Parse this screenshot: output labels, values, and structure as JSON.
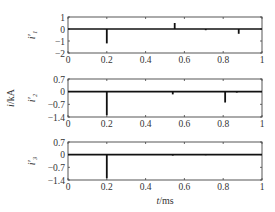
{
  "chart_data": [
    {
      "type": "line",
      "ylabel": "i'1",
      "xlabel": "",
      "xlim": [
        0,
        1
      ],
      "ylim": [
        -2,
        1
      ],
      "xticks": [
        "0",
        "0.2",
        "0.4",
        "0.6",
        "0.8",
        "1"
      ],
      "yticks": [
        "1",
        "0",
        "-1",
        "-2"
      ],
      "baseline": 0,
      "spikes": [
        {
          "x": 0.2,
          "y": -1.2
        },
        {
          "x": 0.55,
          "y": 0.5
        },
        {
          "x": 0.71,
          "y": -0.1
        },
        {
          "x": 0.88,
          "y": -0.4
        }
      ]
    },
    {
      "type": "line",
      "ylabel": "i'2",
      "xlabel": "",
      "xlim": [
        0,
        1
      ],
      "ylim": [
        -1.4,
        0.7
      ],
      "xticks": [
        "0",
        "0.2",
        "0.4",
        "0.6",
        "0.8",
        "1"
      ],
      "yticks": [
        "0.7",
        "0",
        "-0.7",
        "-1.4"
      ],
      "baseline": 0,
      "spikes": [
        {
          "x": 0.2,
          "y": -1.3
        },
        {
          "x": 0.54,
          "y": -0.15
        },
        {
          "x": 0.81,
          "y": -0.6
        },
        {
          "x": 0.87,
          "y": -0.05
        }
      ]
    },
    {
      "type": "line",
      "ylabel": "i'3",
      "xlabel": "t/ms",
      "xlim": [
        0,
        1
      ],
      "ylim": [
        -1.4,
        0.7
      ],
      "xticks": [
        "0",
        "0.2",
        "0.4",
        "0.6",
        "0.8",
        "1"
      ],
      "yticks": [
        "0.7",
        "0",
        "-0.7",
        "-1.4"
      ],
      "baseline": 0,
      "spikes": [
        {
          "x": 0.2,
          "y": -1.3
        },
        {
          "x": 0.54,
          "y": -0.05
        },
        {
          "x": 0.71,
          "y": -0.03
        }
      ]
    }
  ],
  "shared_ylabel": "i/kA",
  "labels": {
    "y1": "i'1",
    "y2": "i'2",
    "y3": "i'3",
    "shared_y": "i/kA",
    "x": "t/ms"
  }
}
